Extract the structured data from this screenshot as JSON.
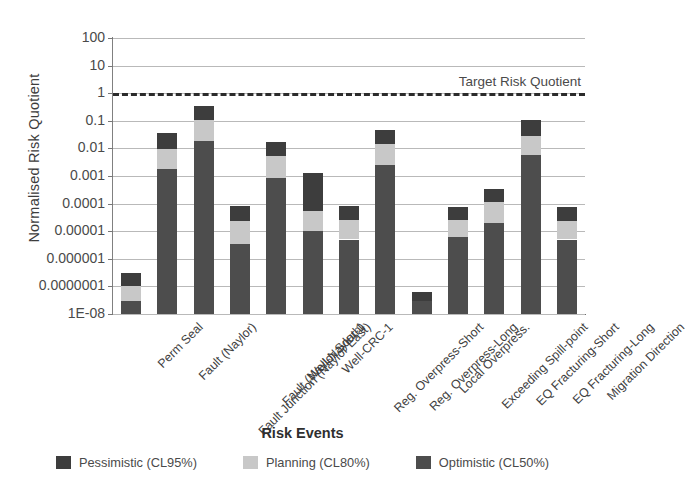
{
  "chart_data": {
    "type": "bar",
    "stacked": true,
    "title": "",
    "xlabel": "Risk Events",
    "ylabel": "Normalised Risk Quotient",
    "yscale": "log",
    "ylim": [
      1e-08,
      100
    ],
    "grid": true,
    "legend_position": "bottom",
    "ytick_labels": [
      "100",
      "10",
      "1",
      "0.1",
      "0.01",
      "0.001",
      "0.0001",
      "0.00001",
      "0.000001",
      "0.0000001",
      "1E-08"
    ],
    "ytick_values": [
      100,
      10,
      1,
      0.1,
      0.01,
      0.001,
      0.0001,
      1e-05,
      1e-06,
      1e-07,
      1e-08
    ],
    "categories": [
      "Perm Seal",
      "Fault (Naylor)",
      "Fault Junction (Naylor East)",
      "Fault (Naylor South)",
      "Well-Naylor-1",
      "Well-CRC-1",
      "Reg. Overpress-Short",
      "Reg. Overpress-Long",
      "Local Overpress.",
      "Exceeding Spill-point",
      "EQ Fracturing-Short",
      "EQ Fracturing-Long",
      "Migration Direction"
    ],
    "series": [
      {
        "name": "Optimistic (CL50%)",
        "color": "#4d4d4d",
        "values": [
          3e-08,
          0.0018,
          0.018,
          3.5e-06,
          0.00085,
          1e-05,
          5e-06,
          0.0025,
          3e-08,
          6e-06,
          2e-05,
          0.006,
          5e-06
        ]
      },
      {
        "name": "Planning (CL80%)",
        "color": "#c8c8c8",
        "values": [
          7e-08,
          0.008,
          0.09,
          2e-05,
          0.0045,
          4.5e-05,
          2e-05,
          0.012,
          0,
          2e-05,
          9e-05,
          0.022,
          1.8e-05
        ]
      },
      {
        "name": "Pessimistic (CL95%)",
        "color": "#3d3d3d",
        "values": [
          2e-07,
          0.025,
          0.25,
          6e-05,
          0.012,
          0.0012,
          6e-05,
          0.033,
          3.5e-08,
          5e-05,
          0.00023,
          0.075,
          5.5e-05
        ]
      }
    ],
    "reference_line": {
      "label": "Target Risk Quotient",
      "value": 1,
      "style": "dashed",
      "color": "#2b2b2b"
    }
  },
  "legend": {
    "items": [
      {
        "label": "Pessimistic (CL95%)",
        "color": "#3d3d3d",
        "key": "pes"
      },
      {
        "label": "Planning (CL80%)",
        "color": "#c8c8c8",
        "key": "pln"
      },
      {
        "label": "Optimistic (CL50%)",
        "color": "#4d4d4d",
        "key": "opt"
      }
    ]
  }
}
